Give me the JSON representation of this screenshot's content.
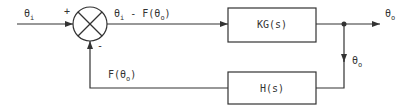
{
  "diagram": {
    "type": "feedback-control-block-diagram",
    "colors": {
      "stroke": "#333333",
      "background": "#ffffff"
    },
    "input": {
      "symbol": "θ",
      "subscript": "i"
    },
    "summing_junction": {
      "plus_sign": "+",
      "minus_sign": "-"
    },
    "error_signal": {
      "prefix": "θ",
      "subscript": "i",
      "rest_a": " - F(θ",
      "rest_sub": "o",
      "rest_b": ")"
    },
    "forward_block": {
      "label": "KG(s)"
    },
    "output": {
      "symbol": "θ",
      "subscript": "o"
    },
    "takeoff_label": {
      "symbol": "θ",
      "subscript": "o"
    },
    "feedback_block": {
      "label": "H(s)"
    },
    "feedback_signal": {
      "prefix": "F(θ",
      "subscript": "o",
      "suffix": ")"
    }
  }
}
